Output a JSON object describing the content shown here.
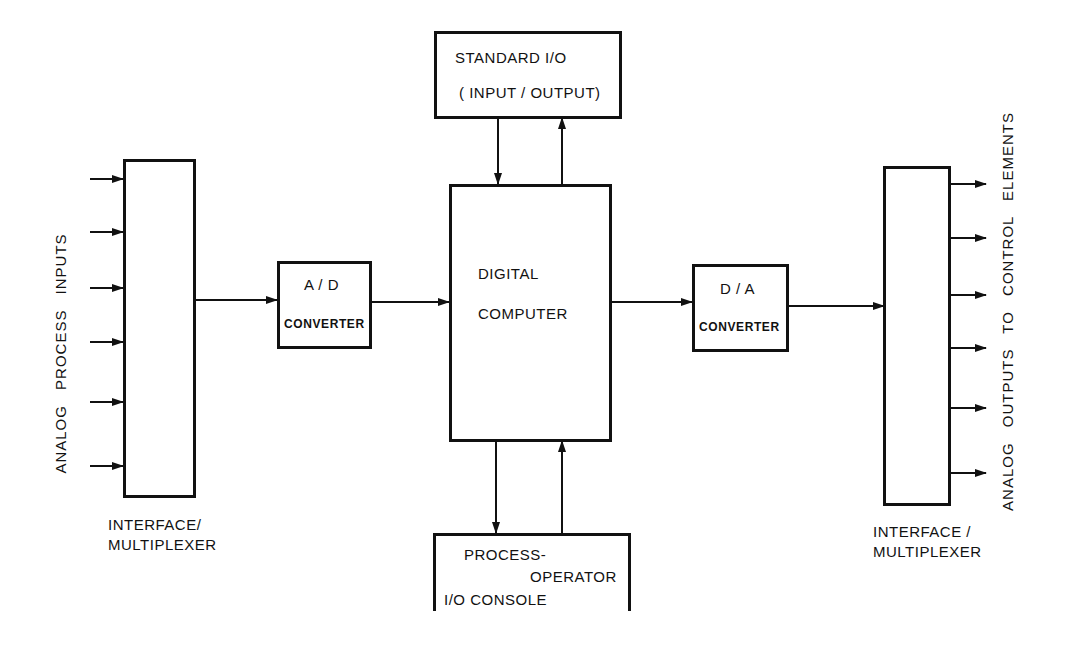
{
  "diagram": {
    "left_mux": {
      "label_line1": "INTERFACE/",
      "label_line2": "MULTIPLEXER",
      "input_count": 6
    },
    "left_side_label": "ANALOG  PROCESS  INPUTS",
    "ad_converter": {
      "title": "A / D",
      "subtitle": "CONVERTER"
    },
    "digital_computer": {
      "line1": "DIGITAL",
      "line2": "COMPUTER"
    },
    "standard_io": {
      "line1": "STANDARD  I/O",
      "line2": "( INPUT / OUTPUT)"
    },
    "console": {
      "line1": "PROCESS-",
      "line2": "OPERATOR",
      "line3": "I/O  CONSOLE"
    },
    "da_converter": {
      "title": "D / A",
      "subtitle": "CONVERTER"
    },
    "right_mux": {
      "label_line1": "INTERFACE /",
      "label_line2": "MULTIPLEXER",
      "output_count": 6
    },
    "right_side_label": "ANALOG  OUTPUTS  TO  CONTROL  ELEMENTS",
    "colors": {
      "line": "#111111",
      "background": "#ffffff"
    }
  }
}
